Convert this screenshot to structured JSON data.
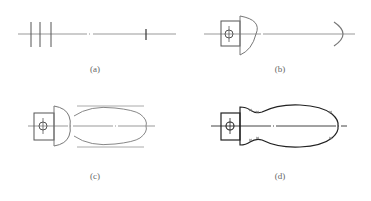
{
  "figure": {
    "panels": [
      {
        "id": "a",
        "label": "(a)",
        "description": "Centerline with three vertical construction lines at left and one short tick at right"
      },
      {
        "id": "b",
        "label": "(b)",
        "description": "Square boss with circled hole, hemispherical head arc, and right end arc"
      },
      {
        "id": "c",
        "label": "(c)",
        "description": "Head, neck and elongated bulb outline construction with tangent guide lines"
      },
      {
        "id": "d",
        "label": "(d)",
        "description": "Finished handle outline with tangent points marked"
      }
    ],
    "colors": {
      "line_dark": "#333333",
      "line_light": "#999999",
      "label": "#666666"
    }
  }
}
